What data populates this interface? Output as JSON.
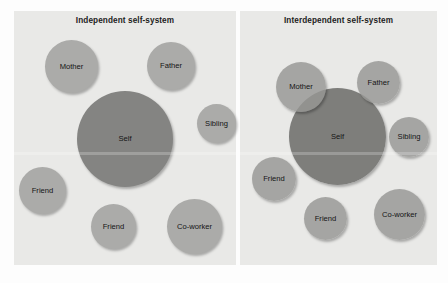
{
  "figure": {
    "type": "conceptual-diagram",
    "colors": {
      "panel_background": "#e9e9e7",
      "peripheral_circle": "#ababa9",
      "self_circle": "#848482",
      "label_text": "#141414",
      "page_background": "#fdfdfd"
    }
  },
  "panels": [
    {
      "id": "independent",
      "title": "Independent self-system",
      "nodes": [
        {
          "label": "Mother",
          "x": 45,
          "y": 40,
          "size": 53,
          "kind": "peripheral"
        },
        {
          "label": "Father",
          "x": 147,
          "y": 42,
          "size": 48,
          "kind": "peripheral"
        },
        {
          "label": "Sibling",
          "x": 197,
          "y": 104,
          "size": 39,
          "kind": "peripheral"
        },
        {
          "label": "Self",
          "x": 77,
          "y": 91,
          "size": 96,
          "kind": "self"
        },
        {
          "label": "Friend",
          "x": 19,
          "y": 167,
          "size": 47,
          "kind": "peripheral"
        },
        {
          "label": "Friend",
          "x": 91,
          "y": 204,
          "size": 45,
          "kind": "peripheral"
        },
        {
          "label": "Co-worker",
          "x": 167,
          "y": 199,
          "size": 55,
          "kind": "peripheral"
        }
      ]
    },
    {
      "id": "interdependent",
      "title": "Interdependent self-system",
      "nodes": [
        {
          "label": "Self",
          "x": 289,
          "y": 88,
          "size": 97,
          "kind": "self"
        },
        {
          "label": "Mother",
          "x": 276,
          "y": 62,
          "size": 50,
          "kind": "peripheral"
        },
        {
          "label": "Father",
          "x": 357,
          "y": 61,
          "size": 43,
          "kind": "peripheral"
        },
        {
          "label": "Sibling",
          "x": 389,
          "y": 117,
          "size": 40,
          "kind": "peripheral"
        },
        {
          "label": "Friend",
          "x": 252,
          "y": 157,
          "size": 44,
          "kind": "peripheral"
        },
        {
          "label": "Friend",
          "x": 304,
          "y": 197,
          "size": 43,
          "kind": "peripheral"
        },
        {
          "label": "Co-worker",
          "x": 374,
          "y": 189,
          "size": 51,
          "kind": "peripheral"
        }
      ]
    }
  ]
}
